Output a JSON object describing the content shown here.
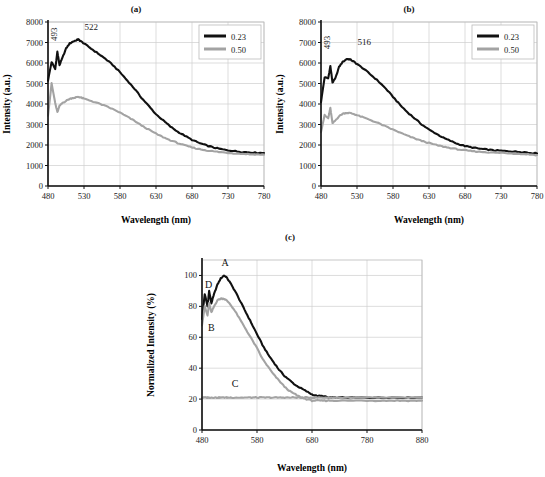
{
  "figure": {
    "panels": [
      "(a)",
      "(b)",
      "(c)"
    ]
  },
  "panel_a": {
    "title": "(a)",
    "xlabel": "Wavelength (nm)",
    "ylabel": "Intensity (a.u.)",
    "xticks": [
      "480",
      "530",
      "580",
      "630",
      "680",
      "730",
      "780"
    ],
    "yticks": [
      "0",
      "1000",
      "2000",
      "3000",
      "4000",
      "5000",
      "6000",
      "7000",
      "8000"
    ],
    "annotations": [
      "493",
      "522"
    ],
    "legend": [
      "0.23",
      "0.50"
    ]
  },
  "panel_b": {
    "title": "(b)",
    "xlabel": "Wavelength (nm)",
    "ylabel": "Intensity (a.u.)",
    "xticks": [
      "480",
      "530",
      "580",
      "630",
      "680",
      "730",
      "780"
    ],
    "yticks": [
      "0",
      "1000",
      "2000",
      "3000",
      "4000",
      "5000",
      "6000",
      "7000",
      "8000"
    ],
    "annotations": [
      "493",
      "516"
    ],
    "legend": [
      "0.23",
      "0.50"
    ]
  },
  "panel_c": {
    "title": "(c)",
    "xlabel": "Wavelength (nm)",
    "ylabel": "Normalized Intensity (%)",
    "xticks": [
      "480",
      "580",
      "680",
      "780",
      "880"
    ],
    "yticks": [
      "0",
      "20",
      "40",
      "60",
      "80",
      "100"
    ],
    "curve_labels": [
      "A",
      "B",
      "C",
      "D"
    ]
  },
  "colors": {
    "series_dark": "#111111",
    "series_gray": "#a3a3a3",
    "grid": "#cfcfcf",
    "axis": "#111111",
    "background": "#ffffff"
  },
  "chart_data": [
    {
      "type": "line",
      "panel": "(a)",
      "title": "(a)",
      "xlabel": "Wavelength (nm)",
      "ylabel": "Intensity (a.u.)",
      "xlim": [
        480,
        780
      ],
      "ylim": [
        0,
        8000
      ],
      "xticks": [
        480,
        530,
        580,
        630,
        680,
        730,
        780
      ],
      "yticks": [
        0,
        1000,
        2000,
        3000,
        4000,
        5000,
        6000,
        7000,
        8000
      ],
      "grid": true,
      "legend_position": "top-right",
      "annotations": [
        {
          "text": "493",
          "x": 493,
          "y": 7400,
          "rotation": -90
        },
        {
          "text": "522",
          "x": 540,
          "y": 7600,
          "rotation": 0
        }
      ],
      "x": [
        480,
        485,
        490,
        493,
        496,
        500,
        505,
        510,
        515,
        520,
        522,
        525,
        530,
        540,
        550,
        560,
        570,
        580,
        590,
        600,
        610,
        620,
        630,
        640,
        650,
        660,
        670,
        680,
        690,
        700,
        710,
        720,
        730,
        740,
        750,
        760,
        770,
        780
      ],
      "series": [
        {
          "name": "0.23",
          "color": "#111111",
          "values": [
            5150,
            6050,
            5700,
            6550,
            5900,
            6250,
            6700,
            6950,
            7050,
            7120,
            7150,
            7080,
            6950,
            6700,
            6450,
            6200,
            5900,
            5550,
            5150,
            4750,
            4300,
            3900,
            3500,
            3200,
            2900,
            2650,
            2450,
            2250,
            2100,
            1980,
            1880,
            1800,
            1740,
            1700,
            1660,
            1640,
            1620,
            1610
          ]
        },
        {
          "name": "0.50",
          "color": "#a3a3a3",
          "values": [
            3450,
            5000,
            4050,
            3600,
            3900,
            4050,
            4150,
            4250,
            4300,
            4330,
            4350,
            4320,
            4260,
            4150,
            4030,
            3900,
            3750,
            3580,
            3380,
            3180,
            2950,
            2750,
            2550,
            2380,
            2230,
            2100,
            1980,
            1880,
            1800,
            1740,
            1690,
            1650,
            1620,
            1590,
            1570,
            1550,
            1540,
            1530
          ]
        }
      ]
    },
    {
      "type": "line",
      "panel": "(b)",
      "title": "(b)",
      "xlabel": "Wavelength (nm)",
      "ylabel": "Intensity (a.u.)",
      "xlim": [
        480,
        780
      ],
      "ylim": [
        0,
        8000
      ],
      "xticks": [
        480,
        530,
        580,
        630,
        680,
        730,
        780
      ],
      "yticks": [
        0,
        1000,
        2000,
        3000,
        4000,
        5000,
        6000,
        7000,
        8000
      ],
      "grid": true,
      "legend_position": "top-right",
      "annotations": [
        {
          "text": "493",
          "x": 493,
          "y": 7000,
          "rotation": -90
        },
        {
          "text": "516",
          "x": 540,
          "y": 6900,
          "rotation": 0
        }
      ],
      "x": [
        480,
        485,
        490,
        493,
        496,
        500,
        505,
        510,
        516,
        520,
        525,
        530,
        540,
        550,
        560,
        570,
        580,
        590,
        600,
        610,
        620,
        630,
        640,
        650,
        660,
        670,
        680,
        690,
        700,
        710,
        720,
        730,
        740,
        750,
        760,
        770,
        780
      ],
      "series": [
        {
          "name": "0.23",
          "color": "#111111",
          "values": [
            4100,
            5300,
            5250,
            5850,
            5050,
            5250,
            5800,
            6050,
            6200,
            6180,
            6080,
            5950,
            5700,
            5400,
            5100,
            4750,
            4350,
            3950,
            3600,
            3300,
            3000,
            2750,
            2550,
            2350,
            2200,
            2050,
            1950,
            1880,
            1820,
            1780,
            1740,
            1720,
            1700,
            1680,
            1660,
            1620,
            1590
          ]
        },
        {
          "name": "0.50",
          "color": "#a3a3a3",
          "values": [
            2650,
            3450,
            3300,
            3800,
            3050,
            3200,
            3400,
            3520,
            3570,
            3560,
            3520,
            3450,
            3330,
            3200,
            3060,
            2900,
            2750,
            2600,
            2450,
            2320,
            2200,
            2100,
            2000,
            1920,
            1850,
            1790,
            1740,
            1700,
            1670,
            1650,
            1630,
            1620,
            1600,
            1580,
            1560,
            1540,
            1510
          ]
        }
      ]
    },
    {
      "type": "line",
      "panel": "(c)",
      "title": "(c)",
      "xlabel": "Wavelength (nm)",
      "ylabel": "Normalized Intensity (%)",
      "xlim": [
        480,
        880
      ],
      "ylim": [
        0,
        110
      ],
      "xticks": [
        480,
        580,
        680,
        780,
        880
      ],
      "yticks": [
        0,
        20,
        40,
        60,
        80,
        100
      ],
      "grid": true,
      "legend_position": "none",
      "annotations": [
        {
          "text": "A",
          "x": 522,
          "y": 106,
          "rotation": 0
        },
        {
          "text": "D",
          "x": 492,
          "y": 92,
          "rotation": 0
        },
        {
          "text": "B",
          "x": 497,
          "y": 64,
          "rotation": 0
        },
        {
          "text": "C",
          "x": 540,
          "y": 28,
          "rotation": 0
        }
      ],
      "x": [
        480,
        485,
        490,
        493,
        497,
        502,
        508,
        514,
        520,
        524,
        530,
        540,
        550,
        560,
        570,
        580,
        590,
        600,
        610,
        620,
        630,
        640,
        650,
        660,
        670,
        680,
        690,
        700,
        710,
        720,
        740,
        760,
        780,
        800,
        820,
        840,
        860,
        880
      ],
      "series": [
        {
          "name": "A",
          "color": "#111111",
          "values": [
            72,
            88,
            80,
            90,
            82,
            88,
            94,
            98,
            100,
            99,
            96,
            90,
            83,
            76,
            69,
            62,
            55,
            49,
            44,
            39,
            35,
            32,
            29,
            27,
            25,
            23,
            22,
            22,
            21,
            21,
            21,
            21,
            21,
            21,
            21,
            21,
            21,
            21
          ]
        },
        {
          "name": "B",
          "color": "#a3a3a3",
          "values": [
            68,
            80,
            74,
            82,
            76,
            80,
            84,
            85,
            85,
            84,
            82,
            77,
            71,
            65,
            59,
            53,
            46,
            41,
            36,
            32,
            28,
            25,
            23,
            21,
            20,
            19,
            19,
            19,
            19,
            19,
            19,
            19,
            19,
            19,
            19,
            19,
            19,
            19
          ]
        },
        {
          "name": "C",
          "color": "#a3a3a3",
          "values": [
            21,
            21,
            21,
            21,
            21,
            21,
            21,
            21,
            21,
            21,
            21,
            21,
            21,
            21,
            21,
            21,
            21,
            21,
            21,
            21,
            21,
            21,
            21,
            21,
            21,
            21,
            21,
            21,
            21,
            21,
            21,
            21,
            21,
            21,
            21,
            21,
            21,
            21
          ]
        }
      ]
    }
  ]
}
